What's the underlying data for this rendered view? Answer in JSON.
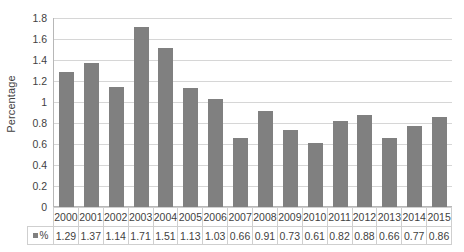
{
  "chart_data": {
    "type": "bar",
    "title": "",
    "subtitle": "",
    "xlabel": "",
    "ylabel": "Percentage",
    "ylim": [
      0,
      1.8
    ],
    "ytick_step": 0.2,
    "yticks": [
      "1.8",
      "1.6",
      "1.4",
      "1.2",
      "1",
      "0.8",
      "0.6",
      "0.4",
      "0.2",
      "0"
    ],
    "ytick_values": [
      1.8,
      1.6,
      1.4,
      1.2,
      1,
      0.8,
      0.6,
      0.4,
      0.2,
      0
    ],
    "grid": true,
    "legend_position": "data-table",
    "categories": [
      "2000",
      "2001",
      "2002",
      "2003",
      "2004",
      "2005",
      "2006",
      "2007",
      "2008",
      "2009",
      "2010",
      "2011",
      "2012",
      "2013",
      "2014",
      "2015"
    ],
    "values": [
      1.29,
      1.37,
      1.14,
      1.71,
      1.51,
      1.13,
      1.03,
      0.66,
      0.91,
      0.73,
      0.61,
      0.82,
      0.88,
      0.66,
      0.77,
      0.86
    ],
    "series": [
      {
        "name": "%",
        "color": "#808080",
        "values": [
          1.29,
          1.37,
          1.14,
          1.71,
          1.51,
          1.13,
          1.03,
          0.66,
          0.91,
          0.73,
          0.61,
          0.82,
          0.88,
          0.66,
          0.77,
          0.86
        ]
      }
    ],
    "value_labels": [
      "1.29",
      "1.37",
      "1.14",
      "1.71",
      "1.51",
      "1.13",
      "1.03",
      "0.66",
      "0.91",
      "0.73",
      "0.61",
      "0.82",
      "0.88",
      "0.66",
      "0.77",
      "0.86"
    ]
  },
  "data_table": {
    "series_label": "%",
    "legend_marker": "square-marker"
  },
  "colors": {
    "bar": "#808080",
    "gridline": "#d6d6d6",
    "axis": "#b7b7b7",
    "table_border": "#cfcfcf",
    "text": "#3f3f3f",
    "background": "#ffffff"
  }
}
